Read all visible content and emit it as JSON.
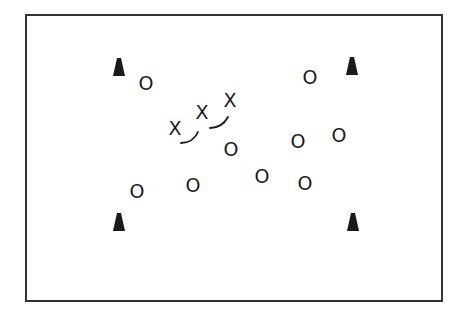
{
  "diagram": {
    "type": "sports-drill-field",
    "field": {
      "x": 26,
      "y": 15,
      "width": 416,
      "height": 286,
      "stroke": "#333333"
    },
    "cones": [
      {
        "id": "cone-top-left",
        "x": 119,
        "y": 68
      },
      {
        "id": "cone-top-right",
        "x": 352,
        "y": 67
      },
      {
        "id": "cone-bottom-left",
        "x": 119,
        "y": 223
      },
      {
        "id": "cone-bottom-right",
        "x": 353,
        "y": 223
      }
    ],
    "attackers": {
      "symbol": "X",
      "players": [
        {
          "label": "X",
          "x": 175,
          "y": 128
        },
        {
          "label": "X",
          "x": 202,
          "y": 112
        },
        {
          "label": "X",
          "x": 230,
          "y": 100
        }
      ]
    },
    "defenders": {
      "symbol": "O",
      "players": [
        {
          "label": "O",
          "x": 146,
          "y": 83
        },
        {
          "label": "O",
          "x": 310,
          "y": 77
        },
        {
          "label": "O",
          "x": 231,
          "y": 149
        },
        {
          "label": "O",
          "x": 298,
          "y": 141
        },
        {
          "label": "O",
          "x": 339,
          "y": 135
        },
        {
          "label": "O",
          "x": 137,
          "y": 191
        },
        {
          "label": "O",
          "x": 193,
          "y": 185
        },
        {
          "label": "O",
          "x": 262,
          "y": 176
        },
        {
          "label": "O",
          "x": 305,
          "y": 183
        }
      ]
    },
    "movement_arcs": [
      {
        "from": "x1",
        "to": "x2",
        "path": "M181 143 Q193 143 198 132"
      },
      {
        "from": "x2",
        "to": "x3",
        "path": "M210 128 Q222 128 228 117"
      }
    ],
    "colors": {
      "ink": "#1a1a1a",
      "background": "#ffffff"
    }
  }
}
